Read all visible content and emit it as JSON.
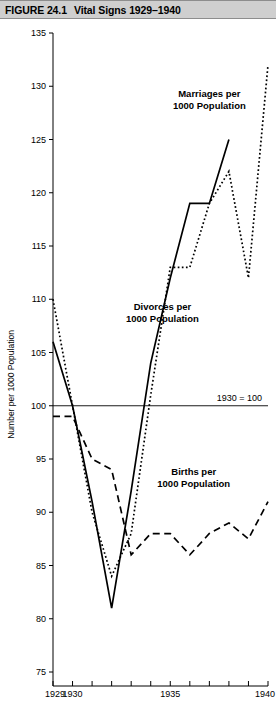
{
  "figure": {
    "number": "FIGURE 24.1",
    "title": "Vital Signs 1929–1940"
  },
  "chart_data": {
    "type": "line",
    "title": "Vital Signs 1929–1940",
    "xlabel": "",
    "ylabel": "Number per 1000 Population",
    "xlim": [
      1929,
      1940
    ],
    "ylim": [
      75,
      135
    ],
    "yticks": [
      135,
      130,
      125,
      120,
      115,
      110,
      105,
      100,
      95,
      90,
      85,
      80,
      75
    ],
    "xticks": [
      1929,
      1930,
      1931,
      1932,
      1933,
      1934,
      1935,
      1936,
      1937,
      1938,
      1939,
      1940
    ],
    "xtick_labels_shown": [
      "1929",
      "1930",
      "1935",
      "1940"
    ],
    "grid": false,
    "legend": "inline-annotations",
    "reference_line": {
      "value": 100,
      "label": "1930 = 100"
    },
    "x": [
      1929,
      1930,
      1931,
      1932,
      1933,
      1934,
      1935,
      1936,
      1937,
      1938,
      1939,
      1940
    ],
    "series": [
      {
        "name": "Marriages per 1000 Population",
        "style": "dotted",
        "values": [
          110,
          100,
          90,
          84,
          88,
          101,
          113,
          113,
          119,
          122,
          112,
          132
        ]
      },
      {
        "name": "Divorces per 1000 Population",
        "style": "solid",
        "values": [
          106,
          100,
          91,
          81,
          92,
          104,
          112,
          119,
          119,
          125,
          null,
          null
        ]
      },
      {
        "name": "Births per 1000 Population",
        "style": "dashed",
        "values": [
          99,
          99,
          95,
          94,
          86,
          88,
          88,
          86,
          88,
          89,
          87.5,
          91
        ]
      }
    ],
    "annotations": [
      {
        "text_line1": "Marriages per",
        "text_line2": "1000 Population",
        "x": 1937,
        "y": 129
      },
      {
        "text_line1": "Divorces per",
        "text_line2": "1000 Population",
        "x": 1934.6,
        "y": 109
      },
      {
        "text_line1": "Births per",
        "text_line2": "1000 Population",
        "x": 1936.2,
        "y": 93.5
      }
    ]
  },
  "colors": {
    "titlebar_bg": "#cfcfcf",
    "ink": "#000000",
    "page_bg": "#ffffff"
  }
}
